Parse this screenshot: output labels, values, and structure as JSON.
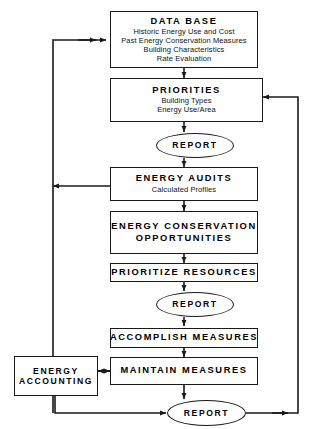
{
  "diagram": {
    "background": "#ffffff",
    "line_color": "#1a1a1a",
    "text_color": "#000000"
  },
  "nodes": {
    "database": {
      "title": "DATA BASE",
      "shape": "box",
      "lines": [
        "Historic Energy Use and Cost",
        "Past Energy Conservation Measures",
        "Building Characteristics",
        "Rate Evaluation"
      ]
    },
    "priorities": {
      "title": "PRIORITIES",
      "shape": "box",
      "lines": [
        "Building Types",
        "Energy Use/Area"
      ]
    },
    "report1": {
      "title": "REPORT",
      "shape": "ellipse",
      "lines": []
    },
    "energy_audits": {
      "title": "ENERGY AUDITS",
      "shape": "box",
      "lines": [
        "Calculated Profiles"
      ]
    },
    "eco": {
      "title": "ENERGY CONSERVATION",
      "title2": "OPPORTUNITIES",
      "shape": "box",
      "lines": []
    },
    "prioritize": {
      "title": "PRIORITIZE RESOURCES",
      "shape": "box",
      "lines": []
    },
    "report2": {
      "title": "REPORT",
      "shape": "ellipse",
      "lines": []
    },
    "accomplish": {
      "title": "ACCOMPLISH MEASURES",
      "shape": "box",
      "lines": []
    },
    "maintain": {
      "title": "MAINTAIN MEASURES",
      "shape": "box",
      "lines": []
    },
    "energy_accounting": {
      "title": "ENERGY",
      "title2": "ACCOUNTING",
      "shape": "box",
      "lines": []
    },
    "report3": {
      "title": "REPORT",
      "shape": "ellipse",
      "lines": []
    }
  }
}
